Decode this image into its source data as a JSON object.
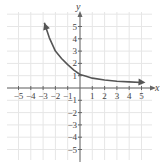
{
  "chart_data": {
    "type": "line",
    "title": "",
    "xlabel": "x",
    "ylabel": "y",
    "xlim": [
      -5.5,
      5.8
    ],
    "ylim": [
      -5.8,
      6.2
    ],
    "grid": true,
    "x_ticks": [
      -5,
      -4,
      -3,
      -2,
      -1,
      1,
      2,
      3,
      4,
      5
    ],
    "y_ticks": [
      5,
      4,
      3,
      2,
      1,
      -1,
      -2,
      -3,
      -4,
      -5
    ],
    "x_tick_labels": [
      "−5",
      "−4",
      "−3",
      "−2",
      "−1",
      "1",
      "2",
      "3",
      "4",
      "5"
    ],
    "y_tick_labels": [
      "5",
      "4",
      "3",
      "2",
      "1",
      "−1",
      "−2",
      "−3",
      "−4",
      "−5"
    ],
    "series": [
      {
        "name": "curve",
        "x": [
          -2.9,
          -2.5,
          -2.0,
          -1.5,
          -1.0,
          -0.5,
          0,
          0.5,
          1,
          2,
          3,
          4,
          5
        ],
        "y": [
          5.3,
          4.1,
          3.0,
          2.4,
          1.9,
          1.45,
          1.1,
          0.95,
          0.8,
          0.65,
          0.55,
          0.5,
          0.45
        ],
        "arrows": "both",
        "color": "#555555"
      }
    ]
  },
  "labels": {
    "x_axis": "x",
    "y_axis": "y"
  }
}
